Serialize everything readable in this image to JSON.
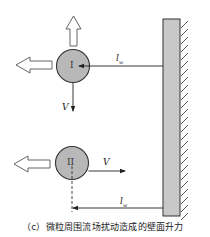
{
  "figure": {
    "caption": "（c）微粒周围流场扰动造成的壁面升力",
    "colors": {
      "particle_fill": "#b8b8b8",
      "wall_fill": "#c8c8c8",
      "stroke": "#333333",
      "hollow_arrow_fill": "#ffffff"
    }
  },
  "particle_1": {
    "label": "I",
    "velocity_label": "V",
    "velocity_direction": "down",
    "distance_label": "l",
    "distance_subscript": "w",
    "lift_arrows": [
      "left",
      "up"
    ]
  },
  "particle_2": {
    "label": "II",
    "velocity_label": "V",
    "velocity_direction": "right",
    "distance_label": "l",
    "distance_subscript": "w",
    "lift_arrows": [
      "left"
    ]
  },
  "wall": {
    "type": "hatched-wall"
  }
}
